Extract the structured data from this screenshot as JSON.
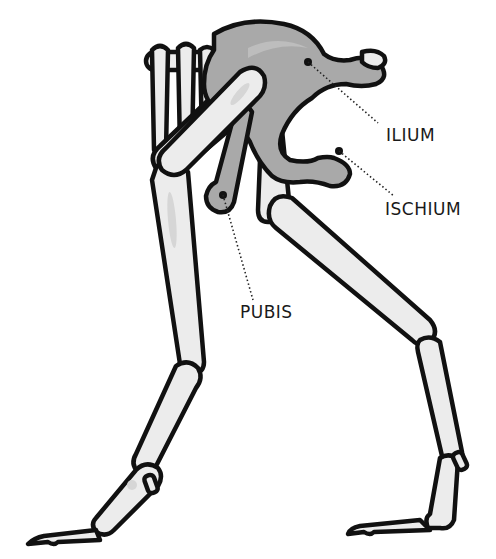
{
  "diagram": {
    "labels": [
      {
        "id": "ilium",
        "text": "ILIUM"
      },
      {
        "id": "ischium",
        "text": "ISCHIUM"
      },
      {
        "id": "pubis",
        "text": "PUBIS"
      }
    ],
    "colors": {
      "bone_fill": "#ececec",
      "pelvis_fill": "#a9a9a9",
      "outline": "#111111",
      "background": "#ffffff"
    }
  }
}
